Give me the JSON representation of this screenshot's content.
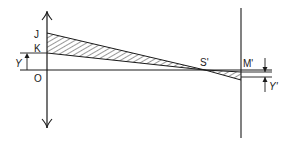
{
  "diagram": {
    "type": "optics-ray-diagram",
    "labels": {
      "J": "J",
      "K": "K",
      "O": "O",
      "Y": "Y",
      "S_prime": "S'",
      "M_prime": "M'",
      "Y_prime": "Y'"
    },
    "colors": {
      "stroke": "#1a1a1a",
      "background": "#ffffff"
    }
  }
}
